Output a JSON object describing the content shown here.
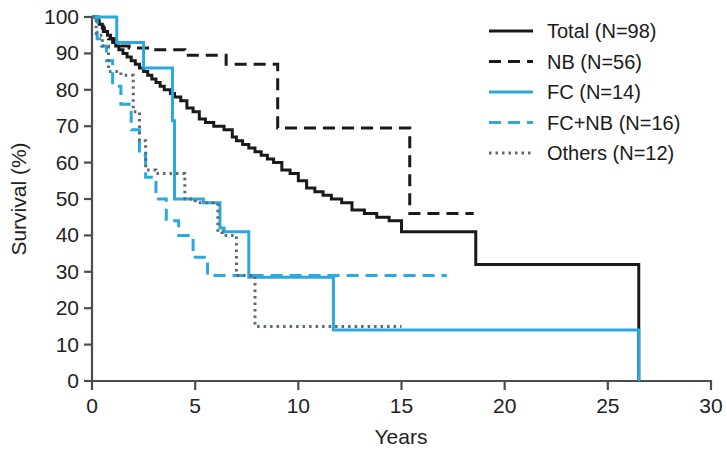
{
  "chart_data": {
    "type": "line",
    "title": "",
    "xlabel": "Years",
    "ylabel": "Survival (%)",
    "xlim": [
      0,
      30
    ],
    "ylim": [
      0,
      100
    ],
    "xticks": [
      0,
      5,
      10,
      15,
      20,
      25,
      30
    ],
    "yticks": [
      0,
      10,
      20,
      30,
      40,
      50,
      60,
      70,
      80,
      90,
      100
    ],
    "grid": false,
    "legend_position": "top-right",
    "colors": {
      "black": "#1a1a1a",
      "blue": "#2aa9e0",
      "axis": "#4d4d4d",
      "background": "#ffffff"
    },
    "series": [
      {
        "name": "Total (N=98)",
        "label": "Total (N=98)",
        "color": "#1a1a1a",
        "dash": "none",
        "width": 3.0,
        "points": [
          [
            0,
            100
          ],
          [
            0.25,
            99
          ],
          [
            0.35,
            98
          ],
          [
            0.5,
            97
          ],
          [
            0.6,
            96
          ],
          [
            0.75,
            95
          ],
          [
            0.9,
            94
          ],
          [
            1.0,
            93
          ],
          [
            1.15,
            92
          ],
          [
            1.3,
            91
          ],
          [
            1.5,
            90
          ],
          [
            1.7,
            89
          ],
          [
            1.9,
            88
          ],
          [
            2.1,
            87
          ],
          [
            2.3,
            86
          ],
          [
            2.5,
            85
          ],
          [
            2.7,
            84
          ],
          [
            2.9,
            83
          ],
          [
            3.1,
            82
          ],
          [
            3.3,
            81
          ],
          [
            3.5,
            80
          ],
          [
            3.8,
            79
          ],
          [
            4.0,
            78
          ],
          [
            4.3,
            77
          ],
          [
            4.6,
            75
          ],
          [
            4.9,
            74
          ],
          [
            5.2,
            72
          ],
          [
            5.5,
            71
          ],
          [
            5.9,
            70
          ],
          [
            6.4,
            69
          ],
          [
            6.8,
            67
          ],
          [
            7.0,
            66
          ],
          [
            7.3,
            65
          ],
          [
            7.6,
            64
          ],
          [
            7.9,
            63
          ],
          [
            8.2,
            62
          ],
          [
            8.5,
            61
          ],
          [
            8.8,
            60
          ],
          [
            9.2,
            58
          ],
          [
            9.6,
            57
          ],
          [
            10.0,
            55
          ],
          [
            10.4,
            53
          ],
          [
            10.8,
            52
          ],
          [
            11.2,
            51
          ],
          [
            11.6,
            50
          ],
          [
            12.1,
            49
          ],
          [
            12.6,
            47
          ],
          [
            13.2,
            46
          ],
          [
            13.8,
            45
          ],
          [
            14.4,
            44
          ],
          [
            15.0,
            41
          ],
          [
            15.6,
            41
          ],
          [
            17.5,
            41
          ],
          [
            18.6,
            32
          ],
          [
            26.5,
            32
          ],
          [
            26.5,
            0
          ]
        ]
      },
      {
        "name": "NB (N=56)",
        "label": "NB (N=56)",
        "color": "#1a1a1a",
        "dash": "12,7",
        "width": 3.0,
        "points": [
          [
            0,
            100
          ],
          [
            0.3,
            98
          ],
          [
            0.55,
            96
          ],
          [
            0.8,
            94
          ],
          [
            1.1,
            93
          ],
          [
            1.4,
            92
          ],
          [
            1.8,
            91.5
          ],
          [
            3.0,
            91
          ],
          [
            4.2,
            91
          ],
          [
            4.5,
            89.5
          ],
          [
            6.2,
            89.5
          ],
          [
            6.5,
            87
          ],
          [
            9.0,
            87
          ],
          [
            9.0,
            69.5
          ],
          [
            15.4,
            69.5
          ],
          [
            15.4,
            46
          ],
          [
            18.5,
            46
          ]
        ]
      },
      {
        "name": "FC (N=14)",
        "label": "FC (N=14)",
        "color": "#2aa9e0",
        "dash": "none",
        "width": 3.0,
        "points": [
          [
            0,
            100
          ],
          [
            1.2,
            100
          ],
          [
            1.2,
            93
          ],
          [
            2.5,
            93
          ],
          [
            2.5,
            86
          ],
          [
            3.9,
            86
          ],
          [
            3.9,
            71.5
          ],
          [
            4.0,
            71.5
          ],
          [
            4.0,
            50
          ],
          [
            5.4,
            50
          ],
          [
            5.4,
            49
          ],
          [
            6.2,
            49
          ],
          [
            6.2,
            42
          ],
          [
            6.4,
            42
          ],
          [
            6.4,
            41
          ],
          [
            7.6,
            41
          ],
          [
            7.6,
            28.5
          ],
          [
            11.7,
            28.5
          ],
          [
            11.7,
            14
          ],
          [
            26.5,
            14
          ],
          [
            26.5,
            0
          ]
        ]
      },
      {
        "name": "FC+NB (N=16)",
        "label": "FC+NB (N=16)",
        "color": "#2aa9e0",
        "dash": "12,7",
        "width": 3.0,
        "points": [
          [
            0,
            100
          ],
          [
            0.25,
            94
          ],
          [
            0.45,
            92
          ],
          [
            0.7,
            88
          ],
          [
            1.0,
            88
          ],
          [
            1.0,
            81
          ],
          [
            1.4,
            81
          ],
          [
            1.4,
            76
          ],
          [
            1.9,
            76
          ],
          [
            1.9,
            69
          ],
          [
            2.3,
            69
          ],
          [
            2.3,
            62
          ],
          [
            2.6,
            62
          ],
          [
            2.6,
            56
          ],
          [
            3.1,
            56
          ],
          [
            3.1,
            50
          ],
          [
            3.6,
            50
          ],
          [
            3.6,
            44
          ],
          [
            4.2,
            44
          ],
          [
            4.2,
            40
          ],
          [
            4.9,
            40
          ],
          [
            4.9,
            34
          ],
          [
            5.6,
            34
          ],
          [
            5.6,
            29
          ],
          [
            6.9,
            29
          ],
          [
            6.9,
            29
          ],
          [
            8.0,
            29
          ],
          [
            17.2,
            29
          ]
        ]
      },
      {
        "name": "Others (N=12)",
        "label": "Others (N=12)",
        "color": "#5a6a70",
        "dash": "2.5,4",
        "width": 3.0,
        "points": [
          [
            0,
            100
          ],
          [
            0.2,
            95
          ],
          [
            0.5,
            92
          ],
          [
            0.8,
            92
          ],
          [
            0.8,
            85
          ],
          [
            1.4,
            85
          ],
          [
            1.4,
            84
          ],
          [
            2.0,
            84
          ],
          [
            2.0,
            74
          ],
          [
            2.3,
            74
          ],
          [
            2.3,
            66
          ],
          [
            2.6,
            66
          ],
          [
            2.6,
            58
          ],
          [
            3.1,
            58
          ],
          [
            3.1,
            57
          ],
          [
            4.5,
            57
          ],
          [
            4.5,
            50
          ],
          [
            5.0,
            50
          ],
          [
            5.0,
            49
          ],
          [
            6.1,
            49
          ],
          [
            6.1,
            41
          ],
          [
            6.3,
            41
          ],
          [
            6.3,
            40
          ],
          [
            7.0,
            40
          ],
          [
            7.0,
            29
          ],
          [
            7.9,
            29
          ],
          [
            7.9,
            15
          ],
          [
            15.0,
            15
          ]
        ]
      }
    ]
  },
  "axes": {
    "x": {
      "label": "Years",
      "ticks": [
        "0",
        "5",
        "10",
        "15",
        "20",
        "25",
        "30"
      ]
    },
    "y": {
      "label": "Survival (%)",
      "ticks": [
        "0",
        "10",
        "20",
        "30",
        "40",
        "50",
        "60",
        "70",
        "80",
        "90",
        "100"
      ]
    }
  },
  "legend": {
    "items": [
      {
        "label": "Total (N=98)",
        "color": "#1a1a1a",
        "dash": "none"
      },
      {
        "label": "NB (N=56)",
        "color": "#1a1a1a",
        "dash": "12,7"
      },
      {
        "label": "FC (N=14)",
        "color": "#2aa9e0",
        "dash": "none"
      },
      {
        "label": "FC+NB (N=16)",
        "color": "#2aa9e0",
        "dash": "12,7"
      },
      {
        "label": "Others (N=12)",
        "color": "#5a6a70",
        "dash": "2.5,4"
      }
    ]
  }
}
